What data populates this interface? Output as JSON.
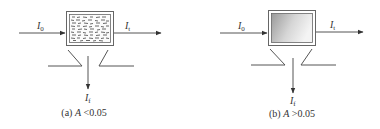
{
  "figure": {
    "panels": [
      {
        "id": "a",
        "caption_prefix": "(a) ",
        "caption_var": "A",
        "caption_cond": " <0.05",
        "sample_fill": "scattering-dashes",
        "labels": {
          "incident": {
            "main": "I",
            "sub": "0"
          },
          "transmitted": {
            "main": "I",
            "sub": "t"
          },
          "scattered": {
            "main": "I",
            "sub": "f"
          }
        }
      },
      {
        "id": "b",
        "caption_prefix": "(b) ",
        "caption_var": "A",
        "caption_cond": " >0.05",
        "sample_fill": "gray-gradient",
        "labels": {
          "incident": {
            "main": "I",
            "sub": "0"
          },
          "transmitted": {
            "main": "I",
            "sub": "t"
          },
          "scattered": {
            "main": "I",
            "sub": "f"
          }
        }
      }
    ],
    "colors": {
      "line": "#555555",
      "text": "#333333",
      "gradient_dark": "#9a9a9a",
      "gradient_light": "#f4f4f4"
    }
  }
}
